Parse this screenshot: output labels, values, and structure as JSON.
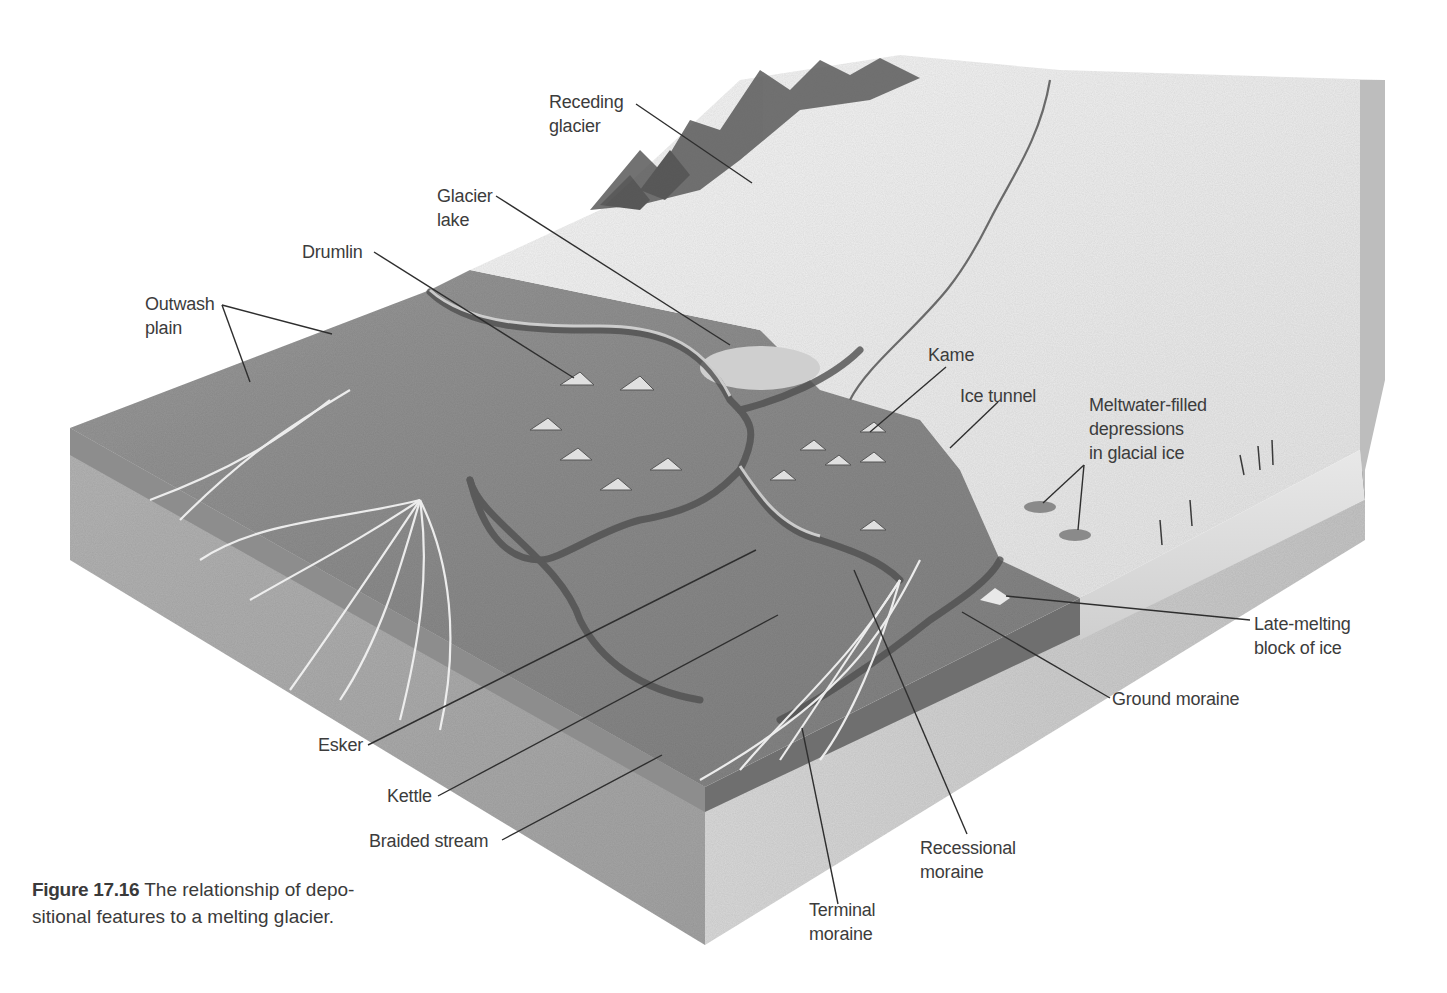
{
  "figure": {
    "number": "Figure 17.16",
    "caption_line1": "The relationship of depo-",
    "caption_line2": "sitional features to a melting glacier."
  },
  "labels": {
    "receding_glacier": [
      "Receding",
      "glacier"
    ],
    "glacier_lake": [
      "Glacier",
      "lake"
    ],
    "drumlin": [
      "Drumlin"
    ],
    "outwash_plain": [
      "Outwash",
      "plain"
    ],
    "kame": [
      "Kame"
    ],
    "ice_tunnel": [
      "Ice tunnel"
    ],
    "meltwater_depressions": [
      "Meltwater-filled",
      "depressions",
      "in glacial ice"
    ],
    "late_melting_block": [
      "Late-melting",
      "block of ice"
    ],
    "ground_moraine": [
      "Ground moraine"
    ],
    "esker": [
      "Esker"
    ],
    "kettle": [
      "Kettle"
    ],
    "braided_stream": [
      "Braided stream"
    ],
    "recessional_moraine": [
      "Recessional",
      "moraine"
    ],
    "terminal_moraine": [
      "Terminal",
      "moraine"
    ]
  },
  "colors": {
    "background": "#ffffff",
    "ground_surface": "#8e8e8e",
    "block_side_light": "#c9c9c9",
    "block_side_dark": "#a9a9a9",
    "ice": "#ececec",
    "mountain": "#5a5a5a",
    "text": "#3c3c3c"
  }
}
